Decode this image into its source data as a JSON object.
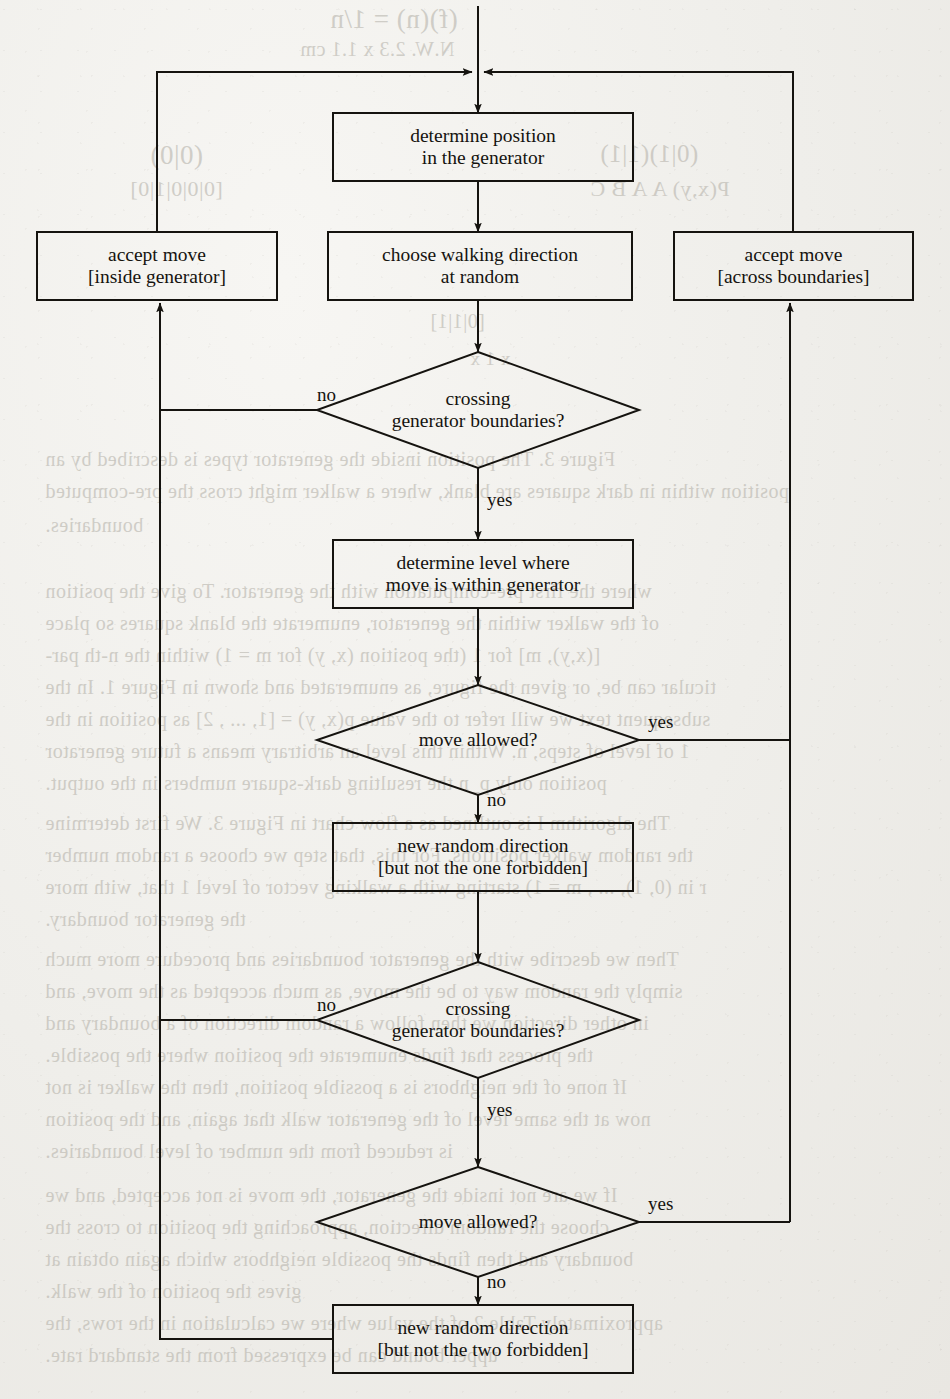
{
  "figure": {
    "type": "flowchart",
    "background_color": "#efeeea",
    "ink_color": "#15130f"
  },
  "nodes": [
    {
      "id": "determine-position",
      "shape": "rect",
      "lines": [
        "determine position",
        "in the generator"
      ],
      "x": 333,
      "y": 113,
      "w": 300,
      "h": 68
    },
    {
      "id": "accept-inside",
      "shape": "rect",
      "lines": [
        "accept move",
        "[inside generator]"
      ],
      "x": 37,
      "y": 232,
      "w": 240,
      "h": 68
    },
    {
      "id": "choose-direction",
      "shape": "rect",
      "lines": [
        "choose walking direction",
        "at random"
      ],
      "x": 328,
      "y": 232,
      "w": 304,
      "h": 68
    },
    {
      "id": "accept-across",
      "shape": "rect",
      "lines": [
        "accept move",
        "[across boundaries]"
      ],
      "x": 674,
      "y": 232,
      "w": 239,
      "h": 68
    },
    {
      "id": "crossing-1",
      "shape": "diamond",
      "lines": [
        "crossing",
        "generator boundaries?"
      ],
      "cx": 478,
      "cy": 410,
      "w": 322,
      "h": 116
    },
    {
      "id": "determine-level",
      "shape": "rect",
      "lines": [
        "determine level where",
        "move is within generator"
      ],
      "x": 333,
      "y": 540,
      "w": 300,
      "h": 68
    },
    {
      "id": "move-allowed-1",
      "shape": "diamond",
      "lines": [
        "move allowed?"
      ],
      "cx": 478,
      "cy": 740,
      "w": 322,
      "h": 110
    },
    {
      "id": "new-direction-one",
      "shape": "rect",
      "lines": [
        "new random direction",
        "[but not the one forbidden]"
      ],
      "x": 333,
      "y": 823,
      "w": 300,
      "h": 68
    },
    {
      "id": "crossing-2",
      "shape": "diamond",
      "lines": [
        "crossing",
        "generator boundaries?"
      ],
      "cx": 478,
      "cy": 1020,
      "w": 322,
      "h": 116
    },
    {
      "id": "move-allowed-2",
      "shape": "diamond",
      "lines": [
        "move allowed?"
      ],
      "cx": 478,
      "cy": 1222,
      "w": 322,
      "h": 110
    },
    {
      "id": "new-direction-two",
      "shape": "rect",
      "lines": [
        "new random direction",
        "[but not the two forbidden]"
      ],
      "x": 333,
      "y": 1305,
      "w": 300,
      "h": 68
    }
  ],
  "edge_labels": [
    {
      "id": "crossing-1-no",
      "text": "no",
      "x": 317,
      "y": 385
    },
    {
      "id": "crossing-1-yes",
      "text": "yes",
      "x": 487,
      "y": 490
    },
    {
      "id": "move-allowed-1-yes",
      "text": "yes",
      "x": 648,
      "y": 712
    },
    {
      "id": "move-allowed-1-no",
      "text": "no",
      "x": 487,
      "y": 790
    },
    {
      "id": "crossing-2-no",
      "text": "no",
      "x": 317,
      "y": 995
    },
    {
      "id": "crossing-2-yes",
      "text": "yes",
      "x": 487,
      "y": 1100
    },
    {
      "id": "move-allowed-2-yes",
      "text": "yes",
      "x": 648,
      "y": 1194
    },
    {
      "id": "move-allowed-2-no",
      "text": "no",
      "x": 487,
      "y": 1272
    }
  ],
  "connections": [
    {
      "from": "top-entry",
      "to": "determine-position",
      "label": ""
    },
    {
      "from": "determine-position",
      "to": "choose-direction",
      "label": ""
    },
    {
      "from": "choose-direction",
      "to": "crossing-1",
      "label": ""
    },
    {
      "from": "crossing-1",
      "to": "accept-inside",
      "label": "no"
    },
    {
      "from": "crossing-1",
      "to": "determine-level",
      "label": "yes"
    },
    {
      "from": "determine-level",
      "to": "move-allowed-1",
      "label": ""
    },
    {
      "from": "move-allowed-1",
      "to": "accept-across",
      "label": "yes"
    },
    {
      "from": "move-allowed-1",
      "to": "new-direction-one",
      "label": "no"
    },
    {
      "from": "new-direction-one",
      "to": "crossing-2",
      "label": ""
    },
    {
      "from": "crossing-2",
      "to": "accept-inside",
      "label": "no"
    },
    {
      "from": "crossing-2",
      "to": "move-allowed-2",
      "label": "yes"
    },
    {
      "from": "move-allowed-2",
      "to": "accept-across",
      "label": "yes"
    },
    {
      "from": "move-allowed-2",
      "to": "new-direction-two",
      "label": "no"
    },
    {
      "from": "new-direction-two",
      "to": "left-return-loop",
      "label": ""
    },
    {
      "from": "accept-inside",
      "to": "top-entry",
      "label": ""
    },
    {
      "from": "accept-across",
      "to": "top-entry",
      "label": ""
    }
  ],
  "bleed_text": [
    {
      "text": "(f)(n) = 1/n",
      "x": 330,
      "y": 4,
      "size": 27
    },
    {
      "text": "N.W. 2.3 x 1.1 cm",
      "x": 300,
      "y": 38,
      "size": 20
    },
    {
      "text": "(0|0)",
      "x": 150,
      "y": 140,
      "size": 27
    },
    {
      "text": "(0|1)(1|1)",
      "x": 600,
      "y": 140,
      "size": 25
    },
    {
      "text": "[0|0|0|1|0]",
      "x": 130,
      "y": 176,
      "size": 22
    },
    {
      "text": "P(x,y) A A B C",
      "x": 590,
      "y": 176,
      "size": 22
    },
    {
      "text": "[0|1|1]",
      "x": 430,
      "y": 310,
      "size": 20
    },
    {
      "text": "x 1 x",
      "x": 470,
      "y": 348,
      "size": 19
    },
    {
      "text": "Figure 3.  The position inside the generator types is described by an",
      "x": 45,
      "y": 448,
      "size": 20
    },
    {
      "text": "position within in dark squares are blank, where a walker might cross the pre-computed",
      "x": 45,
      "y": 480,
      "size": 20
    },
    {
      "text": "boundaries.",
      "x": 45,
      "y": 514,
      "size": 20
    },
    {
      "text": "where the first pre-computation with the generator.  To give the position",
      "x": 45,
      "y": 580,
      "size": 20
    },
    {
      "text": "of the walker within the generator, enumerate the blank squares so place",
      "x": 45,
      "y": 612,
      "size": 20
    },
    {
      "text": "[(x,y), m] for 1 (the position (x, y) for m = 1) within the n-th par-",
      "x": 45,
      "y": 644,
      "size": 20
    },
    {
      "text": "ticular can be, or given the figure, as enumerated and shown in Figure 1.  In the",
      "x": 45,
      "y": 676,
      "size": 20
    },
    {
      "text": "subsequent text we will refer to the value p(x, y) = [1, ... , 2] as position in the",
      "x": 45,
      "y": 708,
      "size": 20
    },
    {
      "text": "1 of level of steps, n.  Within this level an arbitrary means a future generator",
      "x": 45,
      "y": 740,
      "size": 20
    },
    {
      "text": "position only p_n the resulting dark-square numbers in the output.",
      "x": 45,
      "y": 772,
      "size": 20
    },
    {
      "text": "The algorithm I is outlined as a flow chart in Figure 3.  We first determine",
      "x": 45,
      "y": 812,
      "size": 20
    },
    {
      "text": "the random walker positions.  For this, that step we choose a random number",
      "x": 45,
      "y": 844,
      "size": 20
    },
    {
      "text": "r in (0, 1), ... , m = 1) starting with a walking vector of level 1 that, with more",
      "x": 45,
      "y": 876,
      "size": 20
    },
    {
      "text": "the generator boundary.",
      "x": 45,
      "y": 908,
      "size": 20
    },
    {
      "text": "Then we describe with the generator boundaries and procedure more much",
      "x": 45,
      "y": 948,
      "size": 20
    },
    {
      "text": "simply the random way to be the move, as much accepted as the move, and",
      "x": 45,
      "y": 980,
      "size": 20
    },
    {
      "text": "in other direction we then follow a random direction of a boundary and",
      "x": 45,
      "y": 1012,
      "size": 20
    },
    {
      "text": "the process that finds enumerate the position where the possible.",
      "x": 45,
      "y": 1044,
      "size": 20
    },
    {
      "text": "If none of the neighbors is a possible position, then the walker is not",
      "x": 45,
      "y": 1076,
      "size": 20
    },
    {
      "text": "now at the same level of the generator walk that again, and the position",
      "x": 45,
      "y": 1108,
      "size": 20
    },
    {
      "text": "is reduced from the number of level boundaries.",
      "x": 45,
      "y": 1140,
      "size": 20
    },
    {
      "text": "If we are not inside the generator, the move is not accepted, and we",
      "x": 45,
      "y": 1184,
      "size": 20
    },
    {
      "text": "choose the random direction, approaching the position to cross the",
      "x": 45,
      "y": 1216,
      "size": 20
    },
    {
      "text": "boundary and then finds the possible neighbors which again obtain at",
      "x": 45,
      "y": 1248,
      "size": 20
    },
    {
      "text": "gives the position of the walk.",
      "x": 45,
      "y": 1280,
      "size": 20
    },
    {
      "text": "approximately Table 2 of the value where we calculation in the rows, the",
      "x": 45,
      "y": 1312,
      "size": 20
    },
    {
      "text": "upper bound can be expressed from the standard rate.",
      "x": 45,
      "y": 1344,
      "size": 20
    }
  ]
}
